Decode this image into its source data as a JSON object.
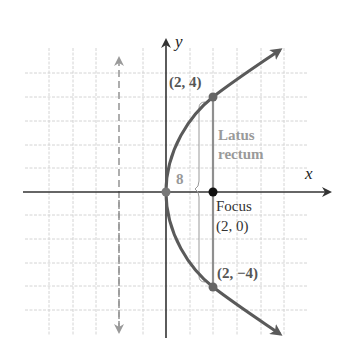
{
  "diagram": {
    "type": "parabola-graph",
    "equation_implied": "y^2 = 8x",
    "axes": {
      "x_label": "x",
      "y_label": "y"
    },
    "colors": {
      "curve": "#5a5a5a",
      "latus_rectum": "#8f8f8f",
      "axis": "#333333",
      "grid": "#d4d4d4",
      "directrix": "#9a9a9a",
      "focus_point": "#111111"
    },
    "points": {
      "upper": {
        "label": "(2, 4)",
        "x": 2,
        "y": 4
      },
      "lower": {
        "label": "(2, −4)",
        "x": 2,
        "y": -4
      },
      "focus": {
        "label_line1": "Focus",
        "label_line2": "(2, 0)",
        "x": 2,
        "y": 0
      },
      "vertex": {
        "x": 0,
        "y": 0
      }
    },
    "latus_rectum": {
      "label_line1": "Latus",
      "label_line2": "rectum",
      "length_label": "8"
    },
    "directrix": {
      "x": -2,
      "style": "dashed"
    },
    "grid": {
      "x_range": [
        -5,
        5
      ],
      "y_range": [
        -5,
        5
      ],
      "unit_px": 23.6
    }
  }
}
